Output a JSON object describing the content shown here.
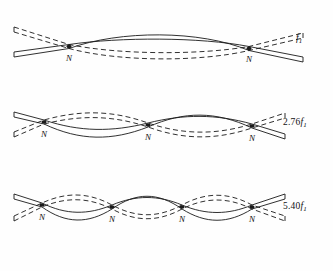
{
  "figure": {
    "background_color": "#fefefe",
    "line_color": "#1a1a1a",
    "width": 333,
    "height": 271
  },
  "node_label": "N",
  "modes": [
    {
      "id": "mode-1",
      "frequency_label": "f1",
      "frequency_coefficient": "",
      "frequency_symbol": "f",
      "frequency_subscript": "1",
      "node_count": 2,
      "node_positions_x": [
        69,
        249
      ],
      "antinode_count": 3,
      "centerline_y": 42,
      "bar_left_x": 14,
      "bar_right_x": 303,
      "label_x": 296,
      "label_y": 33
    },
    {
      "id": "mode-2",
      "frequency_label": "2.76f1",
      "frequency_coefficient": "2.76",
      "frequency_symbol": "f",
      "frequency_subscript": "1",
      "node_count": 3,
      "node_positions_x": [
        44,
        148,
        252
      ],
      "antinode_count": 4,
      "centerline_y": 123,
      "bar_left_x": 14,
      "bar_right_x": 285,
      "label_x": 283,
      "label_y": 117
    },
    {
      "id": "mode-3",
      "frequency_label": "5.40f1",
      "frequency_coefficient": "5.40",
      "frequency_symbol": "f",
      "frequency_subscript": "1",
      "node_count": 4,
      "node_positions_x": [
        42,
        112,
        182,
        252
      ],
      "antinode_count": 5,
      "centerline_y": 207,
      "bar_left_x": 14,
      "bar_right_x": 285,
      "label_x": 283,
      "label_y": 201
    }
  ]
}
